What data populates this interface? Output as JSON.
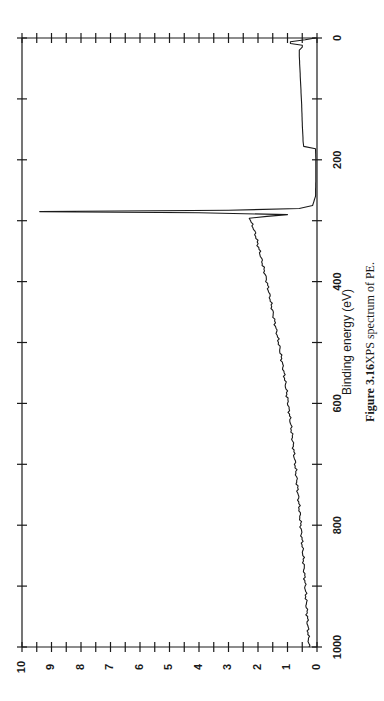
{
  "figure": {
    "caption_number": "Figure 3.16",
    "caption_text": "XPS spectrum of PE."
  },
  "chart_data": {
    "type": "line",
    "title": "",
    "xlabel": "Binding energy (eV)",
    "ylabel": "",
    "orientation": "rotated 90 degrees counter-clockwise on page",
    "xlim": [
      0,
      1000
    ],
    "ylim": [
      0,
      10
    ],
    "x_major_ticks": [
      0,
      200,
      400,
      600,
      800,
      1000
    ],
    "x_minor_ticks": [
      100,
      300,
      500,
      700,
      900
    ],
    "y_major_ticks": [
      0,
      1,
      2,
      3,
      4,
      5,
      6,
      7,
      8,
      9,
      10
    ],
    "y_minor_ticks": [
      0.5,
      1.5,
      2.5,
      3.5,
      4.5,
      5.5,
      6.5,
      7.5,
      8.5,
      9.5
    ],
    "x_tick_labels": [
      "0",
      "200",
      "400",
      "600",
      "800",
      "1000"
    ],
    "y_tick_labels": [
      "0",
      "1",
      "2",
      "3",
      "4",
      "5",
      "6",
      "7",
      "8",
      "9",
      "10"
    ],
    "grid": false,
    "legend": null,
    "series": [
      {
        "name": "PE",
        "color": "#1a1a1a",
        "x": [
          0,
          3,
          6,
          9,
          12,
          15,
          20,
          30,
          50,
          80,
          110,
          140,
          170,
          178,
          182,
          200,
          230,
          260,
          275,
          280,
          283,
          285,
          287,
          290,
          293,
          296,
          300,
          320,
          350,
          400,
          450,
          500,
          550,
          600,
          650,
          700,
          750,
          800,
          850,
          900,
          950,
          1000
        ],
        "y": [
          0.05,
          0.4,
          0.9,
          0.9,
          0.5,
          0.5,
          0.6,
          0.6,
          0.58,
          0.55,
          0.52,
          0.5,
          0.47,
          0.45,
          0.05,
          0.04,
          0.04,
          0.05,
          0.15,
          0.6,
          3.0,
          9.4,
          4.0,
          1.0,
          1.7,
          2.3,
          2.25,
          2.1,
          1.95,
          1.7,
          1.5,
          1.3,
          1.12,
          0.98,
          0.85,
          0.74,
          0.64,
          0.55,
          0.47,
          0.4,
          0.33,
          0.27
        ]
      }
    ],
    "annotations": []
  }
}
